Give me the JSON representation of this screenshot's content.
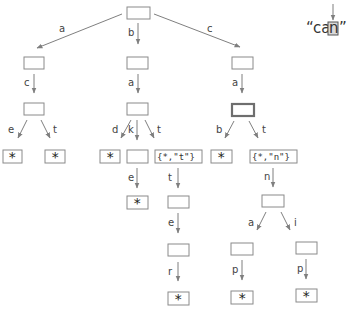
{
  "diagram": {
    "type": "trie",
    "query": {
      "text_open": "“",
      "prefix": "ca",
      "cursor_char": "n",
      "text_close": "”",
      "full": "“can”"
    },
    "edges": {
      "root_a": "a",
      "root_b": "b",
      "root_c": "c",
      "a_c": "c",
      "ac_e": "e",
      "ac_t": "t",
      "b_a": "a",
      "ba_d": "d",
      "ba_k": "k",
      "ba_t": "t",
      "bak_e": "e",
      "bat_t": "t",
      "batt_e": "e",
      "batte_r": "r",
      "c_a": "a",
      "ca_b": "b",
      "ca_t": "t",
      "cat_n": "n",
      "catn_a": "a",
      "catn_i": "i",
      "catna_p": "p",
      "catni_p": "p"
    },
    "values": {
      "terminal": "*",
      "bat": "{*,\"t\"}",
      "cat": "{*,\"n\"}"
    }
  }
}
